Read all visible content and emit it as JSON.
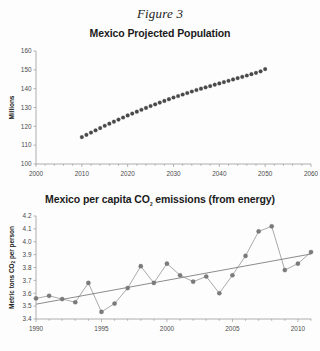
{
  "figure": {
    "label": "Figure 3"
  },
  "charts": [
    {
      "id": "population",
      "title": "Mexico Projected Population"
    },
    {
      "id": "co2",
      "title_prefix": "Mexico per capita CO",
      "title_sub": "2",
      "title_suffix": " emissions (from energy)",
      "ylabel_prefix": "Metric tons CO",
      "ylabel_sub": "2",
      "ylabel_suffix": " per person"
    }
  ],
  "chart_data": [
    {
      "type": "line",
      "title": "Mexico Projected Population",
      "xlabel": "",
      "ylabel": "Millions",
      "xlim": [
        2000,
        2060
      ],
      "ylim": [
        100,
        160
      ],
      "xticks": [
        2000,
        2010,
        2020,
        2030,
        2040,
        2050,
        2060
      ],
      "yticks": [
        100,
        110,
        120,
        130,
        140,
        150,
        160
      ],
      "grid": false,
      "legend": "none",
      "marker": "filled-circle",
      "color": "#4a4a4a",
      "x": [
        2010,
        2011,
        2012,
        2013,
        2014,
        2015,
        2016,
        2017,
        2018,
        2019,
        2020,
        2021,
        2022,
        2023,
        2024,
        2025,
        2026,
        2027,
        2028,
        2029,
        2030,
        2031,
        2032,
        2033,
        2034,
        2035,
        2036,
        2037,
        2038,
        2039,
        2040,
        2041,
        2042,
        2043,
        2044,
        2045,
        2046,
        2047,
        2048,
        2049,
        2050
      ],
      "values": [
        114.3,
        115.5,
        116.7,
        117.9,
        119.1,
        120.3,
        121.4,
        122.5,
        123.6,
        124.7,
        125.8,
        126.8,
        127.8,
        128.8,
        129.8,
        130.8,
        131.7,
        132.6,
        133.5,
        134.4,
        135.3,
        136.1,
        136.9,
        137.7,
        138.5,
        139.3,
        140.0,
        140.7,
        141.4,
        142.1,
        142.8,
        143.5,
        144.2,
        144.9,
        145.6,
        146.3,
        147.0,
        147.7,
        148.4,
        149.2,
        150.4
      ]
    },
    {
      "type": "line",
      "title": "Mexico per capita CO2 emissions (from energy)",
      "xlabel": "",
      "ylabel": "Metric tons CO2 per person",
      "xlim": [
        1990,
        2011
      ],
      "ylim": [
        3.4,
        4.2
      ],
      "xticks": [
        1990,
        1995,
        2000,
        2005,
        2010
      ],
      "yticks": [
        3.4,
        3.5,
        3.6,
        3.7,
        3.8,
        3.9,
        4.0,
        4.1,
        4.2
      ],
      "ytick_labels": [
        "3.4",
        "3.5",
        "3.6",
        "3.7",
        "3.8",
        "3.9",
        "4.0",
        "4.1",
        "4.2"
      ],
      "grid": false,
      "legend": "none",
      "marker": "filled-circle",
      "color": "#7b7b7b",
      "x": [
        1990,
        1991,
        1992,
        1993,
        1994,
        1995,
        1996,
        1997,
        1998,
        1999,
        2000,
        2001,
        2002,
        2003,
        2004,
        2005,
        2006,
        2007,
        2008,
        2009,
        2010,
        2011
      ],
      "values": [
        3.56,
        3.58,
        3.555,
        3.53,
        3.68,
        3.455,
        3.52,
        3.64,
        3.81,
        3.68,
        3.83,
        3.74,
        3.69,
        3.73,
        3.6,
        3.74,
        3.89,
        4.08,
        4.12,
        3.78,
        3.83,
        3.92
      ],
      "trendline": {
        "type": "linear",
        "x": [
          1990,
          2011
        ],
        "y": [
          3.515,
          3.905
        ]
      }
    }
  ]
}
